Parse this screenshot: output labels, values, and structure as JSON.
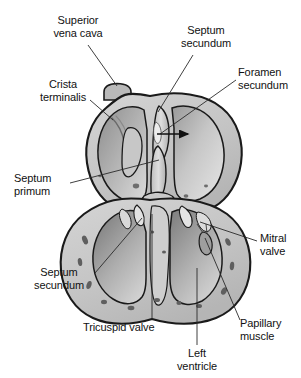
{
  "figure": {
    "background_color": "#ffffff",
    "ink_color": "#111111",
    "width": 301,
    "height": 378
  },
  "palette": {
    "outline": "#1a1a1a",
    "wall_fill": "#c9c9c9",
    "chamber_light": "#e8e8e8",
    "chamber_mid": "#bdbdbd",
    "chamber_dark": "#8f8f8f",
    "trabecula_dark": "#7d7d7d",
    "leader_line": "#2a2a2a"
  },
  "labels": [
    {
      "id": "superior-vena-cava",
      "text": "Superior\nvena cava",
      "line1": "Superior",
      "line2": "vena cava",
      "align": "c",
      "x": 78,
      "y": 14,
      "leader": {
        "x1": 88,
        "y1": 45,
        "x2": 117,
        "y2": 86
      }
    },
    {
      "id": "septum-secundum-top",
      "text": "Septum\nsecundum",
      "line1": "Septum",
      "line2": "secundum",
      "align": "c",
      "x": 206,
      "y": 24,
      "leader": {
        "x1": 193,
        "y1": 55,
        "x2": 158,
        "y2": 112
      }
    },
    {
      "id": "foramen-secundum",
      "text": "Foramen\nsecundum",
      "line1": "Foramen",
      "line2": "secundum",
      "align": "l",
      "x": 238,
      "y": 66,
      "leader": {
        "x1": 236,
        "y1": 80,
        "x2": 160,
        "y2": 134
      }
    },
    {
      "id": "crista-terminalis",
      "text": "Crista\nterminalis",
      "line1": "Crista",
      "line2": "terminalis",
      "align": "c",
      "x": 63,
      "y": 78,
      "leader": {
        "x1": 90,
        "y1": 100,
        "x2": 113,
        "y2": 120
      }
    },
    {
      "id": "septum-primum",
      "text": "Septum\nprimum",
      "line1": "Septum",
      "line2": "primum",
      "align": "l",
      "x": 14,
      "y": 172,
      "leader": {
        "x1": 70,
        "y1": 183,
        "x2": 159,
        "y2": 160
      }
    },
    {
      "id": "septum-secundum-bottom",
      "text": "Septum\nsecundum",
      "line1": "Septum",
      "line2": "secundum",
      "align": "c",
      "x": 59,
      "y": 266,
      "leader": {
        "x1": 95,
        "y1": 273,
        "x2": 142,
        "y2": 218
      }
    },
    {
      "id": "mitral-valve",
      "text": "Mitral\nvalve",
      "line1": "Mitral",
      "line2": "valve",
      "align": "l",
      "x": 260,
      "y": 232,
      "leader": {
        "x1": 257,
        "y1": 241,
        "x2": 200,
        "y2": 222
      }
    },
    {
      "id": "tricuspid-valve",
      "text": "Tricuspid valve",
      "line1": "Tricuspid valve",
      "line2": "",
      "align": "l",
      "x": 83,
      "y": 321,
      "leader": {
        "x1": 152,
        "y1": 319,
        "x2": 152,
        "y2": 214
      }
    },
    {
      "id": "left-ventricle",
      "text": "Left\nventricle",
      "line1": "Left",
      "line2": "ventricle",
      "align": "c",
      "x": 197,
      "y": 347,
      "leader": {
        "x1": 197,
        "y1": 345,
        "x2": 197,
        "y2": 268
      }
    },
    {
      "id": "papillary-muscle",
      "text": "Papillary\nmuscle",
      "line1": "Papillary",
      "line2": "muscle",
      "align": "l",
      "x": 240,
      "y": 317,
      "leader": {
        "x1": 240,
        "y1": 320,
        "x2": 205,
        "y2": 238
      }
    }
  ],
  "arrow": {
    "id": "blood-flow-arrow",
    "x1": 157,
    "y1": 134,
    "x2": 190,
    "y2": 134,
    "direction": "right"
  }
}
